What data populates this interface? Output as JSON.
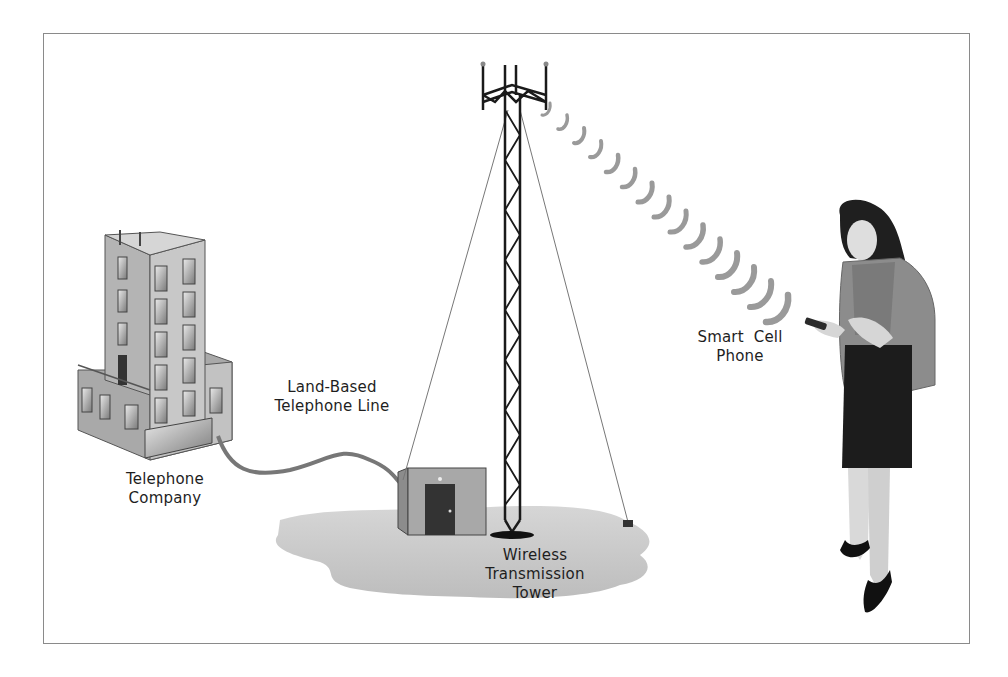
{
  "diagram": {
    "type": "illustration",
    "labels": {
      "telephone_company": "Telephone\nCompany",
      "telephone_company_line1": "Telephone",
      "telephone_company_line2": "Company",
      "land_line_line1": "Land-Based",
      "land_line_line2": "Telephone Line",
      "tower_line1": "Wireless",
      "tower_line2": "Transmission",
      "tower_line3": "Tower",
      "phone_line1": "Smart  Cell",
      "phone_line2": "Phone"
    },
    "nodes": [
      {
        "id": "telephone-company",
        "label": "Telephone Company",
        "icon": "office-building"
      },
      {
        "id": "land-line",
        "label": "Land-Based Telephone Line",
        "icon": "cable"
      },
      {
        "id": "tower",
        "label": "Wireless Transmission Tower",
        "icon": "lattice-tower"
      },
      {
        "id": "phone",
        "label": "Smart Cell Phone",
        "icon": "person-with-phone"
      }
    ],
    "edges": [
      {
        "from": "phone",
        "to": "tower",
        "style": "radio-wave-arcs"
      },
      {
        "from": "tower",
        "to": "telephone-company",
        "style": "cable"
      }
    ],
    "colors": {
      "frame": "#8a8a8a",
      "building": "#b9b9b9",
      "ground": "#c8c8c8",
      "waves": "#9a9a9a",
      "tower": "#1a1a1a",
      "skirt": "#1c1c1c",
      "jacket": "#8c8c8c"
    },
    "wave_count": 16
  }
}
